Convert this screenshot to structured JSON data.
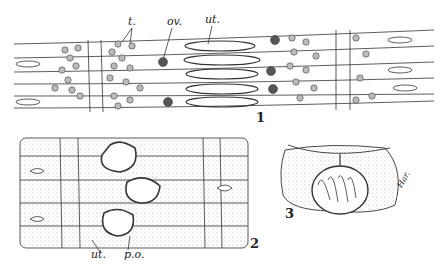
{
  "figure": {
    "panels": [
      {
        "number": "1",
        "description": "longitudinal section of segment strands"
      },
      {
        "number": "2",
        "description": "stippled segments with follicles"
      },
      {
        "number": "3",
        "description": "oval body with fan-shaped structure"
      }
    ],
    "labels": {
      "t": "t.",
      "ov": "ov.",
      "ut_top": "ut.",
      "ut_bottom": "ut.",
      "po": "p.o.",
      "signature": "Har."
    }
  }
}
